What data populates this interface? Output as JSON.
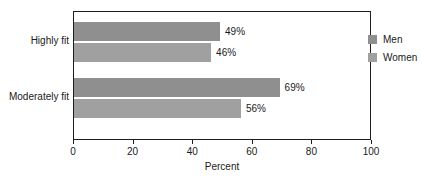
{
  "caption_fragment": "",
  "chart_data": {
    "type": "bar",
    "orientation": "horizontal",
    "title": "",
    "xlabel": "Percent",
    "ylabel": "",
    "xlim": [
      0,
      100
    ],
    "xticks": [
      0,
      20,
      40,
      60,
      80,
      100
    ],
    "xtick_labels": [
      "0",
      "20",
      "40",
      "60",
      "80",
      "100"
    ],
    "grid": false,
    "frame": true,
    "legend_position": "top-right",
    "categories": [
      "Highly fit",
      "Moderately fit"
    ],
    "series": [
      {
        "name": "Men",
        "color": "#8f8f8f",
        "values": [
          49,
          46
        ],
        "value_labels": [
          "49%",
          "46%"
        ]
      },
      {
        "name": "Women",
        "color": "#a0a0a0",
        "values": [
          69,
          56
        ],
        "value_labels": [
          "69%",
          "56%"
        ]
      }
    ],
    "bars": [
      {
        "group": "Highly fit",
        "series": "Men",
        "value": 49,
        "label": "49%",
        "color": "#8f8f8f"
      },
      {
        "group": "Highly fit",
        "series": "Women",
        "value": 46,
        "label": "46%",
        "color": "#a0a0a0"
      },
      {
        "group": "Moderately fit",
        "series": "Men",
        "value": 69,
        "label": "69%",
        "color": "#8f8f8f"
      },
      {
        "group": "Moderately fit",
        "series": "Women",
        "value": 56,
        "label": "56%",
        "color": "#a0a0a0"
      }
    ]
  },
  "legend": {
    "items": [
      {
        "label": "Men",
        "color": "#8f8f8f"
      },
      {
        "label": "Women",
        "color": "#a0a0a0"
      }
    ]
  }
}
